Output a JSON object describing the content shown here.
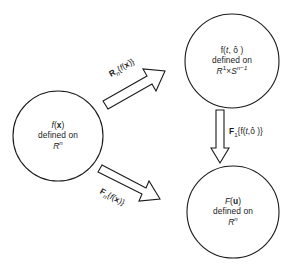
{
  "figure": {
    "type": "commutative-diagram",
    "background_color": "#ffffff",
    "stroke_color": "#1a1a1a"
  },
  "nodes": [
    {
      "id": "spatial-domain",
      "name": "function-circle-fx",
      "line1": "f(x)",
      "line1_parts": {
        "func": "f",
        "open": "(",
        "arg": "x",
        "close": ")"
      },
      "line2": "defined on",
      "line3": "R^n",
      "line3_parts": {
        "base": "R",
        "exponent": "n"
      },
      "center_x": 58,
      "center_y": 136,
      "radius": 45
    },
    {
      "id": "radon-domain",
      "name": "function-circle-f-t-theta",
      "line1": "f(t, ô )",
      "line1_parts": {
        "func": "f",
        "open": "(",
        "arg1": "t",
        "sep": ", ",
        "arg2": "ô",
        "close": " )"
      },
      "line2": "defined on",
      "line3": "R^1×S^n-1",
      "line3_parts": {
        "base1": "R",
        "exp1": "1",
        "times": "×",
        "base2": "S",
        "exp2": "n−1"
      },
      "center_x": 232,
      "center_y": 61,
      "radius": 47
    },
    {
      "id": "frequency-domain",
      "name": "function-circle-Fu",
      "line1": "F(u)",
      "line1_parts": {
        "func": "F",
        "open": "(",
        "arg": "u",
        "close": ")"
      },
      "line2": "defined on",
      "line3": "R^n",
      "line3_parts": {
        "base": "R",
        "exponent": "n"
      },
      "center_x": 233,
      "center_y": 212,
      "radius": 46
    }
  ],
  "arrows": [
    {
      "id": "radon-transform",
      "name": "arrow-radon-transform",
      "label": "Rn{f(x)}",
      "label_parts": {
        "op": "R",
        "sub": "n",
        "brace_open": "{",
        "func": "f",
        "paren_open": "(",
        "arg": "x",
        "paren_close": ")",
        "brace_close": "}"
      },
      "from": "spatial-domain",
      "to": "radon-domain",
      "direction": "up-right"
    },
    {
      "id": "fourier-1d",
      "name": "arrow-fourier-1d",
      "label": "F1{f(t,ô )}",
      "label_parts": {
        "op": "F",
        "sub": "1",
        "brace_open": "{",
        "func": "f",
        "paren_open": "(",
        "arg1": "t",
        "sep": ",",
        "arg2": "ô",
        "paren_close": " )",
        "brace_close": "}"
      },
      "from": "radon-domain",
      "to": "frequency-domain",
      "direction": "down"
    },
    {
      "id": "fourier-nd",
      "name": "arrow-fourier-nd",
      "label": "Fn{f(x)}",
      "label_parts": {
        "op": "F",
        "sub": "n",
        "brace_open": "{",
        "func": "f",
        "paren_open": "(",
        "arg": "x",
        "paren_close": ")",
        "brace_close": "}"
      },
      "from": "spatial-domain",
      "to": "frequency-domain",
      "direction": "down-right"
    }
  ]
}
